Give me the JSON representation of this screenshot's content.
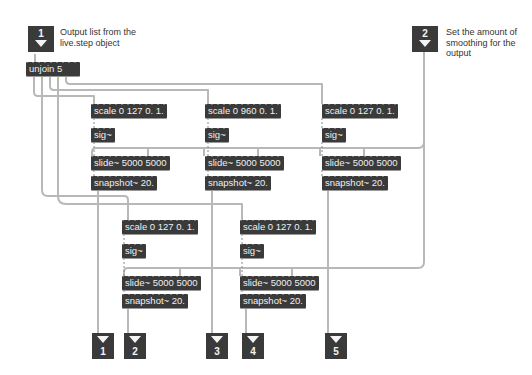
{
  "inlets": [
    {
      "number": "1",
      "comment": "Output list from the live.step object"
    },
    {
      "number": "2",
      "comment": "Set the amount of smoothing for the output"
    }
  ],
  "unjoin": {
    "label": "unjoin 5"
  },
  "chains": [
    {
      "scale": "scale 0 127 0. 1.",
      "sig": "sig~",
      "slide": "slide~ 5000 5000",
      "snapshot": "snapshot~ 20."
    },
    {
      "scale": "scale 0 960 0. 1.",
      "sig": "sig~",
      "slide": "slide~ 5000 5000",
      "snapshot": "snapshot~ 20."
    },
    {
      "scale": "scale 0 127 0. 1.",
      "sig": "sig~",
      "slide": "slide~ 5000 5000",
      "snapshot": "snapshot~ 20."
    },
    {
      "scale": "scale 0 127 0. 1.",
      "sig": "sig~",
      "slide": "slide~ 5000 5000",
      "snapshot": "snapshot~ 20."
    },
    {
      "scale": "scale 0 127 0. 1.",
      "sig": "sig~",
      "slide": "slide~ 5000 5000",
      "snapshot": "snapshot~ 20."
    }
  ],
  "outlets": [
    {
      "number": "1"
    },
    {
      "number": "2"
    },
    {
      "number": "3"
    },
    {
      "number": "4"
    },
    {
      "number": "5"
    }
  ],
  "colors": {
    "object_bg": "#3a3a3a",
    "object_text": "#f0f0f0",
    "patchcord": "#b5b5b5",
    "background": "#ffffff"
  }
}
